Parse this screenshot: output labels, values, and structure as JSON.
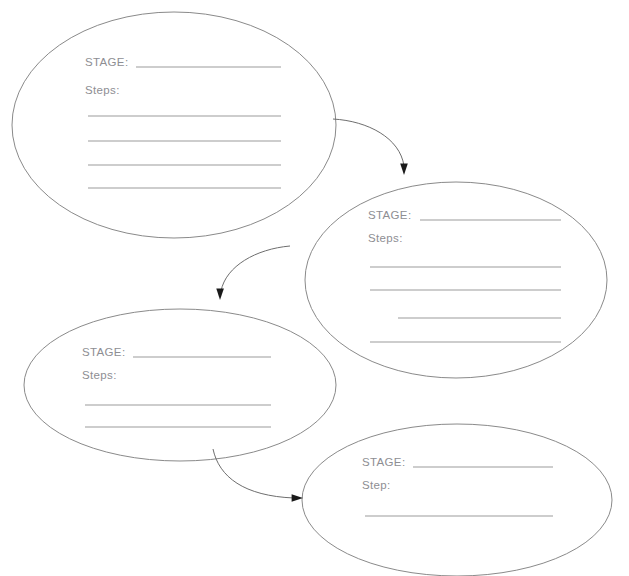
{
  "document": {
    "title": "Stage Flow Worksheet",
    "background_color": "#ffffff",
    "ellipse_stroke_color": "#8a8a8a",
    "label_text_color": "#8e8e93",
    "rule_line_color": "#9b9b9b",
    "arrow_color": "#6e6e6e",
    "arrowhead_color": "#1a1a1a"
  },
  "nodes": [
    {
      "id": "stage-1",
      "stage_label": "STAGE:",
      "steps_label": "Steps:",
      "stage_value": "",
      "step_values": [
        "",
        "",
        "",
        ""
      ],
      "step_line_count": 4,
      "ellipse": {
        "cx": 174,
        "cy": 125,
        "rx": 162,
        "ry": 113
      }
    },
    {
      "id": "stage-2",
      "stage_label": "STAGE:",
      "steps_label": "Steps:",
      "stage_value": "",
      "step_values": [
        "",
        "",
        "",
        ""
      ],
      "step_line_count": 4,
      "ellipse": {
        "cx": 456,
        "cy": 280,
        "rx": 151,
        "ry": 98
      }
    },
    {
      "id": "stage-3",
      "stage_label": "STAGE:",
      "steps_label": "Steps:",
      "stage_value": "",
      "step_values": [
        "",
        ""
      ],
      "step_line_count": 2,
      "ellipse": {
        "cx": 180,
        "cy": 385,
        "rx": 156,
        "ry": 76
      }
    },
    {
      "id": "stage-4",
      "stage_label": "STAGE:",
      "steps_label": "Step:",
      "stage_value": "",
      "step_values": [
        ""
      ],
      "step_line_count": 1,
      "ellipse": {
        "cx": 457,
        "cy": 500,
        "rx": 155,
        "ry": 76
      }
    }
  ],
  "connectors": [
    {
      "id": "arrow-1-to-2",
      "from": "stage-1",
      "to": "stage-2",
      "direction": "down-right"
    },
    {
      "id": "arrow-2-to-3",
      "from": "stage-2",
      "to": "stage-3",
      "direction": "down-left"
    },
    {
      "id": "arrow-3-to-4",
      "from": "stage-3",
      "to": "stage-4",
      "direction": "down-right"
    }
  ]
}
